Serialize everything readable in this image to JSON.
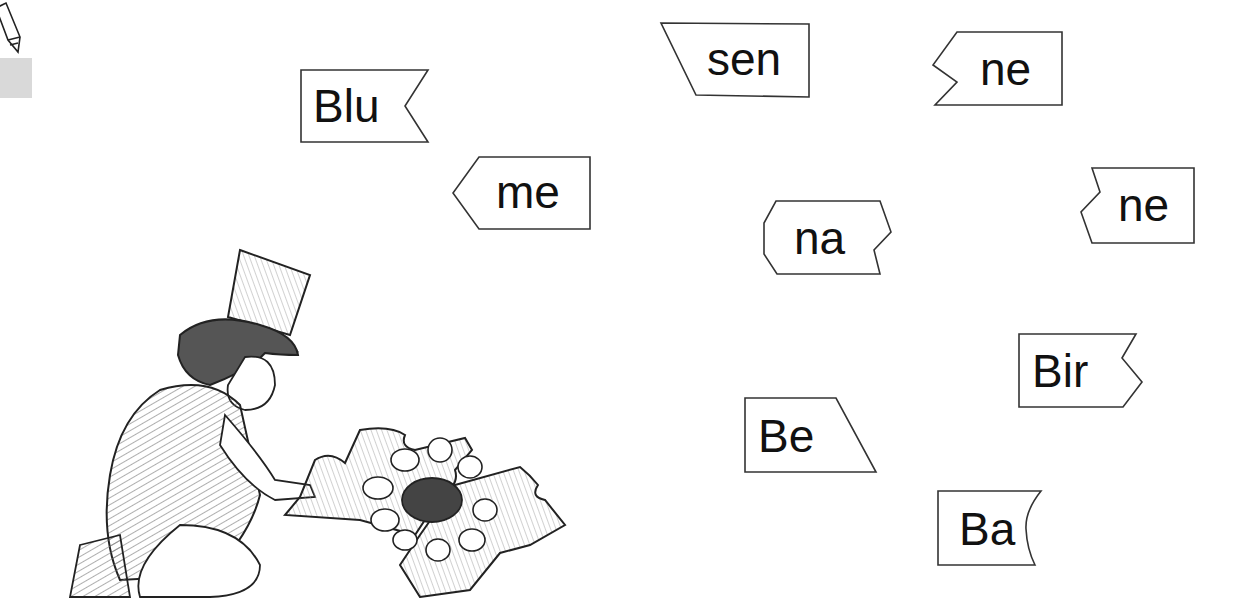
{
  "worksheet": {
    "instruction_icon": "pencil-icon",
    "syllable_cards": [
      {
        "id": "blu",
        "text": "Blu",
        "shape": "notch-right"
      },
      {
        "id": "me",
        "text": "me",
        "shape": "point-left"
      },
      {
        "id": "sen",
        "text": "sen",
        "shape": "slant-left"
      },
      {
        "id": "ne1",
        "text": "ne",
        "shape": "notch-left"
      },
      {
        "id": "na",
        "text": "na",
        "shape": "hex-notch-right"
      },
      {
        "id": "ne2",
        "text": "ne",
        "shape": "notch-left-2"
      },
      {
        "id": "bir",
        "text": "Bir",
        "shape": "notch-right-2"
      },
      {
        "id": "be",
        "text": "Be",
        "shape": "slant-right"
      },
      {
        "id": "ba",
        "text": "Ba",
        "shape": "curve-right"
      }
    ],
    "illustration": "child-in-top-hat-assembling-flower-puzzle"
  }
}
